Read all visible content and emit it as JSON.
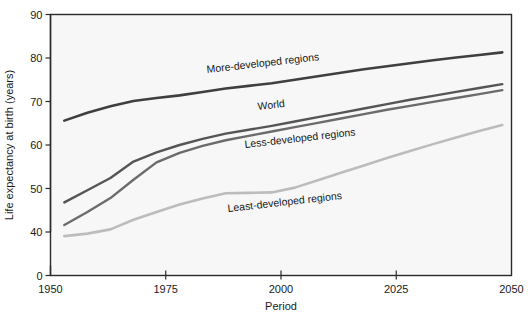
{
  "chart_data": {
    "type": "line",
    "title": "",
    "xlabel": "Period",
    "ylabel": "Life expectancy at birth (years)",
    "xlim": [
      1950,
      2050
    ],
    "ylim": [
      0,
      90
    ],
    "y_axis_break": true,
    "y_break_between": [
      0,
      40
    ],
    "grid": false,
    "legend": "inline-annotations",
    "xticks": [
      1950,
      1975,
      2000,
      2025,
      2050
    ],
    "xtick_labels": [
      "1950",
      "1975",
      "2000",
      "2025",
      "2050"
    ],
    "yticks": [
      0,
      40,
      50,
      60,
      70,
      80,
      90
    ],
    "ytick_labels": [
      "0",
      "40",
      "50",
      "60",
      "70",
      "80",
      "90"
    ],
    "x": [
      1953,
      1958,
      1963,
      1968,
      1973,
      1978,
      1983,
      1988,
      1993,
      1998,
      2003,
      2008,
      2013,
      2018,
      2023,
      2028,
      2033,
      2038,
      2043,
      2048
    ],
    "series": [
      {
        "name": "More-developed regions",
        "color": "#3f3f3f",
        "label": "More-developed regions",
        "label_x": 207,
        "label_y": 73,
        "label_rotation": -6.5,
        "line_width": 2.6,
        "values": [
          65.6,
          67.4,
          68.9,
          70.1,
          70.8,
          71.4,
          72.2,
          73.0,
          73.6,
          74.2,
          75.0,
          75.8,
          76.6,
          77.4,
          78.1,
          78.8,
          79.5,
          80.1,
          80.7,
          81.3
        ]
      },
      {
        "name": "World",
        "color": "#555555",
        "label": "World",
        "label_x": 258,
        "label_y": 110,
        "label_rotation": -6.5,
        "line_width": 2.4,
        "values": [
          46.8,
          49.6,
          52.4,
          56.2,
          58.3,
          60.0,
          61.4,
          62.6,
          63.5,
          64.4,
          65.4,
          66.4,
          67.4,
          68.4,
          69.4,
          70.4,
          71.3,
          72.2,
          73.1,
          74.0
        ]
      },
      {
        "name": "Less-developed regions",
        "color": "#6b6b6b",
        "label": "Less-developed regions",
        "label_x": 245,
        "label_y": 148,
        "label_rotation": -6.5,
        "line_width": 2.4,
        "values": [
          41.6,
          44.6,
          47.8,
          52.0,
          56.0,
          58.2,
          59.8,
          61.1,
          62.1,
          63.1,
          64.1,
          65.1,
          66.1,
          67.1,
          68.1,
          69.0,
          69.9,
          70.8,
          71.7,
          72.6
        ]
      },
      {
        "name": "Least-developed regions",
        "color": "#bcbcbc",
        "label": "Least-developed regions",
        "label_x": 228,
        "label_y": 212,
        "label_rotation": -6.5,
        "line_width": 2.6,
        "values": [
          36.2,
          38.5,
          40.6,
          42.8,
          44.6,
          46.3,
          47.7,
          48.9,
          49.0,
          49.1,
          50.2,
          51.9,
          53.6,
          55.3,
          57.0,
          58.6,
          60.2,
          61.7,
          63.2,
          64.6
        ]
      }
    ]
  },
  "axes": {
    "ylabel": "Life expectancy at birth (years)",
    "xlabel": "Period",
    "ytick_values": [
      "90",
      "80",
      "70",
      "60",
      "50",
      "40",
      "0"
    ],
    "xtick_values": [
      "1950",
      "1975",
      "2000",
      "2025",
      "2050"
    ]
  },
  "colors": {
    "plot_background": "#f7f7f7",
    "page_background": "#ffffff",
    "frame": "#2b2b2b",
    "text": "#1a1a1a"
  }
}
